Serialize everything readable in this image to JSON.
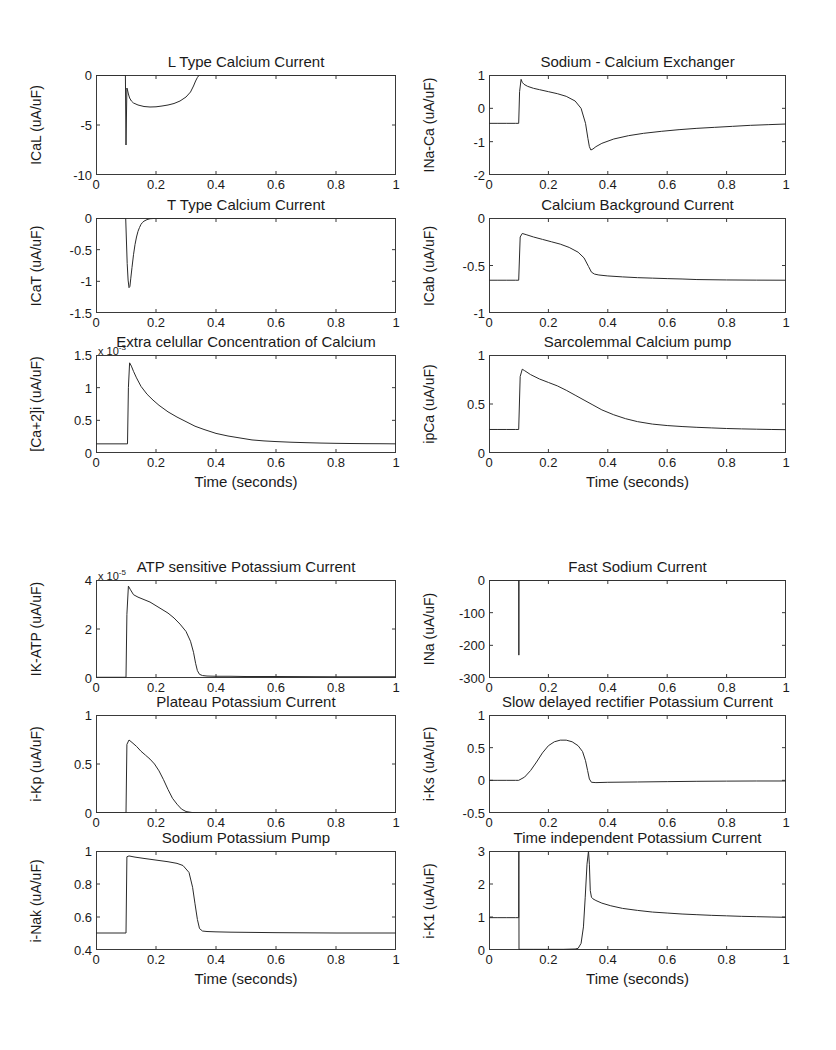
{
  "figure": {
    "xlabel": "Time (seconds)",
    "xticks": [
      "0",
      "0.2",
      "0.4",
      "0.6",
      "0.8",
      "1"
    ],
    "xlim": [
      0,
      1
    ]
  },
  "chart_data": [
    {
      "id": "ical",
      "type": "line",
      "title": "L Type Calcium Current",
      "ylabel": "ICaL (uA/uF)",
      "xlabel": "",
      "xlim": [
        0,
        1
      ],
      "ylim": [
        -10,
        0
      ],
      "yticks": [
        "0",
        "-5",
        "-10"
      ],
      "ytickvals": [
        0,
        -5,
        -10
      ],
      "xticks": [
        "0",
        "0.2",
        "0.4",
        "0.6",
        "0.8",
        "1"
      ],
      "exponent": "",
      "x": [
        0,
        0.02,
        0.04,
        0.06,
        0.08,
        0.098,
        0.1,
        0.1,
        0.103,
        0.105,
        0.108,
        0.112,
        0.118,
        0.125,
        0.14,
        0.16,
        0.18,
        0.2,
        0.22,
        0.24,
        0.26,
        0.28,
        0.3,
        0.315,
        0.325,
        0.332,
        0.338,
        0.342,
        0.35,
        0.4,
        0.5,
        0.6,
        0.7,
        0.8,
        0.9,
        1.0
      ],
      "y": [
        0,
        0,
        0,
        0,
        0,
        0,
        -7.0,
        -6.9,
        -1.3,
        -1.5,
        -1.9,
        -2.3,
        -2.6,
        -2.8,
        -3.0,
        -3.15,
        -3.2,
        -3.18,
        -3.1,
        -3.0,
        -2.85,
        -2.6,
        -2.2,
        -1.7,
        -1.1,
        -0.6,
        -0.25,
        -0.08,
        0,
        0,
        0,
        0,
        0,
        0,
        0,
        0
      ]
    },
    {
      "id": "icat",
      "type": "line",
      "title": "T Type Calcium Current",
      "ylabel": "ICaT (uA/uF)",
      "xlabel": "",
      "xlim": [
        0,
        1
      ],
      "ylim": [
        -1.5,
        0
      ],
      "yticks": [
        "0",
        "-0.5",
        "-1",
        "-1.5"
      ],
      "ytickvals": [
        0,
        -0.5,
        -1,
        -1.5
      ],
      "xticks": [
        "0",
        "0.2",
        "0.4",
        "0.6",
        "0.8",
        "1"
      ],
      "exponent": "",
      "x": [
        0,
        0.03,
        0.06,
        0.09,
        0.099,
        0.101,
        0.104,
        0.107,
        0.11,
        0.113,
        0.116,
        0.12,
        0.125,
        0.13,
        0.135,
        0.14,
        0.145,
        0.15,
        0.155,
        0.16,
        0.17,
        0.18,
        0.2,
        0.3,
        0.5,
        0.7,
        1.0
      ],
      "y": [
        0,
        0,
        0,
        0,
        0,
        -0.3,
        -0.72,
        -0.98,
        -1.1,
        -1.08,
        -0.95,
        -0.78,
        -0.58,
        -0.42,
        -0.3,
        -0.21,
        -0.15,
        -0.1,
        -0.07,
        -0.05,
        -0.025,
        -0.012,
        -0.005,
        0,
        0,
        0,
        0
      ]
    },
    {
      "id": "cai",
      "type": "line",
      "title": "Extra celullar Concentration of Calcium",
      "ylabel": "[Ca+2]i (uA/uF)",
      "xlabel": "Time (seconds)",
      "xlim": [
        0,
        1
      ],
      "ylim": [
        0,
        1.5
      ],
      "yticks": [
        "1.5",
        "1",
        "0.5",
        "0"
      ],
      "ytickvals": [
        1.5,
        1,
        0.5,
        0
      ],
      "xticks": [
        "0",
        "0.2",
        "0.4",
        "0.6",
        "0.8",
        "1"
      ],
      "exponent": "x 10",
      "exponent_power": "-3",
      "x": [
        0,
        0.03,
        0.06,
        0.09,
        0.105,
        0.108,
        0.112,
        0.118,
        0.125,
        0.135,
        0.15,
        0.17,
        0.19,
        0.21,
        0.24,
        0.27,
        0.3,
        0.33,
        0.36,
        0.4,
        0.44,
        0.48,
        0.52,
        0.56,
        0.6,
        0.65,
        0.7,
        0.75,
        0.8,
        0.85,
        0.9,
        0.95,
        1.0
      ],
      "y": [
        0.14,
        0.14,
        0.14,
        0.14,
        0.14,
        1.0,
        1.38,
        1.33,
        1.25,
        1.15,
        1.02,
        0.9,
        0.81,
        0.73,
        0.63,
        0.55,
        0.48,
        0.41,
        0.36,
        0.3,
        0.26,
        0.23,
        0.2,
        0.185,
        0.175,
        0.165,
        0.158,
        0.152,
        0.148,
        0.145,
        0.143,
        0.142,
        0.14
      ]
    },
    {
      "id": "inaca",
      "type": "line",
      "title": "Sodium - Calcium Exchanger",
      "ylabel": "INa-Ca (uA/uF)",
      "xlabel": "",
      "xlim": [
        0,
        1
      ],
      "ylim": [
        -2,
        1
      ],
      "yticks": [
        "1",
        "0",
        "-1",
        "-2"
      ],
      "ytickvals": [
        1,
        0,
        -1,
        -2
      ],
      "xticks": [
        "0",
        "0.2",
        "0.4",
        "0.6",
        "0.8",
        "1"
      ],
      "exponent": "",
      "x": [
        0,
        0.03,
        0.06,
        0.09,
        0.1,
        0.103,
        0.108,
        0.112,
        0.118,
        0.13,
        0.15,
        0.17,
        0.2,
        0.23,
        0.26,
        0.29,
        0.31,
        0.325,
        0.333,
        0.338,
        0.343,
        0.35,
        0.36,
        0.38,
        0.42,
        0.47,
        0.52,
        0.58,
        0.64,
        0.7,
        0.76,
        0.82,
        0.88,
        0.94,
        1.0
      ],
      "y": [
        -0.45,
        -0.45,
        -0.45,
        -0.45,
        -0.45,
        0.5,
        0.87,
        0.78,
        0.72,
        0.66,
        0.6,
        0.56,
        0.5,
        0.44,
        0.36,
        0.22,
        0.0,
        -0.45,
        -0.9,
        -1.15,
        -1.25,
        -1.22,
        -1.15,
        -1.05,
        -0.92,
        -0.82,
        -0.75,
        -0.69,
        -0.64,
        -0.6,
        -0.57,
        -0.54,
        -0.51,
        -0.49,
        -0.47
      ]
    },
    {
      "id": "icab",
      "type": "line",
      "title": "Calcium Background Current",
      "ylabel": "ICab (uA/uF)",
      "xlabel": "",
      "xlim": [
        0,
        1
      ],
      "ylim": [
        -1,
        0
      ],
      "yticks": [
        "0",
        "-0.5",
        "-1"
      ],
      "ytickvals": [
        0,
        -0.5,
        -1
      ],
      "xticks": [
        "0",
        "0.2",
        "0.4",
        "0.6",
        "0.8",
        "1"
      ],
      "exponent": "",
      "x": [
        0,
        0.03,
        0.06,
        0.09,
        0.1,
        0.105,
        0.112,
        0.125,
        0.15,
        0.18,
        0.21,
        0.24,
        0.27,
        0.3,
        0.32,
        0.335,
        0.345,
        0.355,
        0.37,
        0.4,
        0.45,
        0.5,
        0.55,
        0.6,
        0.65,
        0.7,
        0.8,
        0.9,
        1.0
      ],
      "y": [
        -0.655,
        -0.655,
        -0.655,
        -0.655,
        -0.655,
        -0.2,
        -0.163,
        -0.175,
        -0.2,
        -0.225,
        -0.25,
        -0.275,
        -0.31,
        -0.36,
        -0.42,
        -0.51,
        -0.57,
        -0.59,
        -0.6,
        -0.61,
        -0.62,
        -0.628,
        -0.633,
        -0.638,
        -0.642,
        -0.648,
        -0.652,
        -0.654,
        -0.655
      ]
    },
    {
      "id": "ipca",
      "type": "line",
      "title": "Sarcolemmal Calcium pump",
      "ylabel": "ipCa (uA/uF)",
      "xlabel": "Time (seconds)",
      "xlim": [
        0,
        1
      ],
      "ylim": [
        0,
        1
      ],
      "yticks": [
        "1",
        "0.5",
        "0"
      ],
      "ytickvals": [
        1,
        0.5,
        0
      ],
      "xticks": [
        "0",
        "0.2",
        "0.4",
        "0.6",
        "0.8",
        "1"
      ],
      "exponent": "",
      "x": [
        0,
        0.03,
        0.06,
        0.09,
        0.1,
        0.105,
        0.112,
        0.12,
        0.14,
        0.17,
        0.2,
        0.23,
        0.26,
        0.29,
        0.32,
        0.35,
        0.38,
        0.42,
        0.46,
        0.5,
        0.55,
        0.6,
        0.65,
        0.7,
        0.75,
        0.8,
        0.85,
        0.9,
        0.95,
        1.0
      ],
      "y": [
        0.24,
        0.24,
        0.24,
        0.24,
        0.24,
        0.78,
        0.855,
        0.84,
        0.8,
        0.755,
        0.72,
        0.685,
        0.64,
        0.59,
        0.54,
        0.49,
        0.44,
        0.39,
        0.35,
        0.32,
        0.295,
        0.28,
        0.27,
        0.262,
        0.256,
        0.25,
        0.246,
        0.243,
        0.24,
        0.238
      ]
    },
    {
      "id": "ikatp",
      "type": "line",
      "title": "ATP sensitive Potassium Current",
      "ylabel": "IK-ATP (uA/uF)",
      "xlabel": "",
      "xlim": [
        0,
        1
      ],
      "ylim": [
        0,
        4
      ],
      "yticks": [
        "4",
        "2",
        "0"
      ],
      "ytickvals": [
        4,
        2,
        0
      ],
      "xticks": [
        "0",
        "0.2",
        "0.4",
        "0.6",
        "0.8",
        "1"
      ],
      "exponent": "x 10",
      "exponent_power": "-5",
      "x": [
        0,
        0.03,
        0.06,
        0.09,
        0.1,
        0.103,
        0.108,
        0.115,
        0.125,
        0.14,
        0.16,
        0.18,
        0.2,
        0.22,
        0.24,
        0.26,
        0.28,
        0.3,
        0.315,
        0.325,
        0.332,
        0.338,
        0.345,
        0.355,
        0.37,
        0.4,
        0.45,
        0.5,
        0.6,
        0.7,
        0.8,
        0.9,
        1.0
      ],
      "y": [
        0.03,
        0.03,
        0.03,
        0.03,
        0.03,
        2.6,
        3.75,
        3.6,
        3.4,
        3.3,
        3.2,
        3.1,
        2.95,
        2.8,
        2.65,
        2.45,
        2.2,
        1.9,
        1.5,
        1.05,
        0.6,
        0.3,
        0.15,
        0.1,
        0.08,
        0.07,
        0.07,
        0.06,
        0.06,
        0.055,
        0.05,
        0.05,
        0.05
      ]
    },
    {
      "id": "ina",
      "type": "line",
      "title": "Fast Sodium Current",
      "ylabel": "INa (uA/uF)",
      "xlabel": "",
      "xlim": [
        0,
        1
      ],
      "ylim": [
        -300,
        0
      ],
      "yticks": [
        "0",
        "-100",
        "-200",
        "-300"
      ],
      "ytickvals": [
        0,
        -100,
        -200,
        -300
      ],
      "xticks": [
        "0",
        "0.2",
        "0.4",
        "0.6",
        "0.8",
        "1"
      ],
      "exponent": "",
      "x": [
        0,
        0.05,
        0.095,
        0.1,
        0.1005,
        0.101,
        0.105,
        0.12,
        0.2,
        0.4,
        0.6,
        0.8,
        1.0
      ],
      "y": [
        0,
        0,
        0,
        0,
        -230,
        0,
        0,
        0,
        0,
        0,
        0,
        0,
        0
      ]
    },
    {
      "id": "ikp",
      "type": "line",
      "title": "Plateau Potassium Current",
      "ylabel": "i-Kp (uA/uF)",
      "xlabel": "",
      "xlim": [
        0,
        1
      ],
      "ylim": [
        0,
        1
      ],
      "yticks": [
        "1",
        "0.5",
        "0"
      ],
      "ytickvals": [
        1,
        0.5,
        0
      ],
      "xticks": [
        "0",
        "0.2",
        "0.4",
        "0.6",
        "0.8",
        "1"
      ],
      "exponent": "",
      "x": [
        0,
        0.03,
        0.06,
        0.09,
        0.1,
        0.103,
        0.11,
        0.12,
        0.135,
        0.15,
        0.165,
        0.18,
        0.195,
        0.21,
        0.225,
        0.24,
        0.255,
        0.27,
        0.285,
        0.3,
        0.32,
        0.35,
        0.4,
        0.5,
        0.6,
        0.8,
        1.0
      ],
      "y": [
        0.0,
        0.0,
        0.0,
        0.0,
        0.0,
        0.7,
        0.745,
        0.72,
        0.68,
        0.63,
        0.59,
        0.55,
        0.5,
        0.43,
        0.34,
        0.24,
        0.15,
        0.09,
        0.04,
        0.015,
        0.005,
        0.002,
        0.0,
        0.0,
        0.0,
        0.0,
        0.0
      ]
    },
    {
      "id": "iks",
      "type": "line",
      "title": "Slow delayed rectifier Potassium Current",
      "ylabel": "i-Ks (uA/uF)",
      "xlabel": "",
      "xlim": [
        0,
        1
      ],
      "ylim": [
        -0.5,
        1
      ],
      "yticks": [
        "1",
        "0.5",
        "0",
        "-0.5"
      ],
      "ytickvals": [
        1,
        0.5,
        0,
        -0.5
      ],
      "xticks": [
        "0",
        "0.2",
        "0.4",
        "0.6",
        "0.8",
        "1"
      ],
      "exponent": "",
      "x": [
        0,
        0.03,
        0.06,
        0.09,
        0.1,
        0.12,
        0.14,
        0.16,
        0.18,
        0.2,
        0.22,
        0.24,
        0.26,
        0.28,
        0.3,
        0.315,
        0.325,
        0.332,
        0.338,
        0.345,
        0.36,
        0.4,
        0.5,
        0.6,
        0.7,
        0.8,
        0.9,
        1.0
      ],
      "y": [
        0.0,
        0.0,
        0.0,
        0.0,
        0.0,
        0.05,
        0.15,
        0.28,
        0.42,
        0.53,
        0.59,
        0.615,
        0.615,
        0.59,
        0.53,
        0.44,
        0.3,
        0.15,
        0.02,
        -0.03,
        -0.035,
        -0.03,
        -0.025,
        -0.02,
        -0.015,
        -0.012,
        -0.01,
        -0.01
      ]
    },
    {
      "id": "inak",
      "type": "line",
      "title": "Sodium Potassium Pump",
      "ylabel": "i-Nak (uA/uF)",
      "xlabel": "Time (seconds)",
      "xlim": [
        0,
        1
      ],
      "ylim": [
        0.4,
        1
      ],
      "yticks": [
        "1",
        "0.8",
        "0.6",
        "0.4"
      ],
      "ytickvals": [
        1,
        0.8,
        0.6,
        0.4
      ],
      "xticks": [
        "0",
        "0.2",
        "0.4",
        "0.6",
        "0.8",
        "1"
      ],
      "exponent": "",
      "x": [
        0,
        0.03,
        0.06,
        0.09,
        0.1,
        0.103,
        0.11,
        0.13,
        0.16,
        0.2,
        0.24,
        0.27,
        0.29,
        0.31,
        0.322,
        0.33,
        0.338,
        0.345,
        0.355,
        0.37,
        0.4,
        0.45,
        0.5,
        0.6,
        0.7,
        0.8,
        0.9,
        1.0
      ],
      "y": [
        0.503,
        0.503,
        0.503,
        0.503,
        0.503,
        0.965,
        0.97,
        0.963,
        0.955,
        0.945,
        0.935,
        0.925,
        0.912,
        0.87,
        0.78,
        0.68,
        0.585,
        0.53,
        0.515,
        0.512,
        0.51,
        0.508,
        0.507,
        0.505,
        0.504,
        0.503,
        0.503,
        0.503
      ]
    },
    {
      "id": "ik1",
      "type": "line",
      "title": "Time independent Potassium Current",
      "ylabel": "i-K1 (uA/uF)",
      "xlabel": "Time (seconds)",
      "xlim": [
        0,
        1
      ],
      "ylim": [
        0,
        3
      ],
      "yticks": [
        "3",
        "2",
        "1",
        "0"
      ],
      "ytickvals": [
        3,
        2,
        1,
        0
      ],
      "xticks": [
        "0",
        "0.2",
        "0.4",
        "0.6",
        "0.8",
        "1"
      ],
      "exponent": "",
      "x": [
        0,
        0.03,
        0.06,
        0.09,
        0.1,
        0.1005,
        0.101,
        0.15,
        0.2,
        0.25,
        0.29,
        0.3,
        0.31,
        0.318,
        0.324,
        0.33,
        0.335,
        0.338,
        0.341,
        0.345,
        0.35,
        0.36,
        0.38,
        0.41,
        0.45,
        0.5,
        0.55,
        0.6,
        0.65,
        0.7,
        0.75,
        0.8,
        0.85,
        0.9,
        0.95,
        1.0
      ],
      "y": [
        0.98,
        0.98,
        0.98,
        0.98,
        0.98,
        3.0,
        0.02,
        0.02,
        0.02,
        0.02,
        0.03,
        0.05,
        0.2,
        0.7,
        1.6,
        2.6,
        3.0,
        2.6,
        1.8,
        1.6,
        1.55,
        1.5,
        1.42,
        1.34,
        1.26,
        1.2,
        1.15,
        1.12,
        1.09,
        1.07,
        1.05,
        1.035,
        1.02,
        1.01,
        1.0,
        0.99
      ]
    }
  ]
}
